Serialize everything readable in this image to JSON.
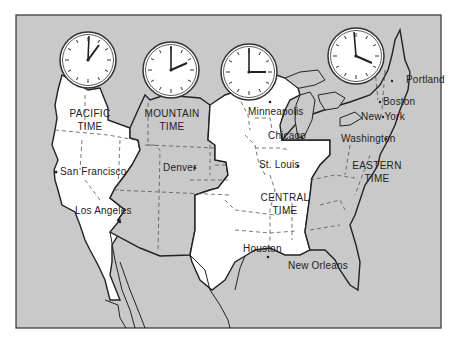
{
  "colors": {
    "water": "#c9c9c9",
    "other_zone_fill": "#c9c9c9",
    "pacific_central_fill": "#ffffff",
    "border": "#222222",
    "dash": "#555555"
  },
  "zones": [
    {
      "name": "PACIFIC",
      "line2": "TIME",
      "clock": {
        "hour": 1,
        "minute": 0
      }
    },
    {
      "name": "MOUNTAIN",
      "line2": "TIME",
      "clock": {
        "hour": 2,
        "minute": 0
      }
    },
    {
      "name": "CENTRAL",
      "line2": "TIME",
      "clock": {
        "hour": 3,
        "minute": 0
      }
    },
    {
      "name": "EASTERN",
      "line2": "TIME",
      "clock": {
        "hour": 4,
        "minute": 0
      }
    }
  ],
  "cities": [
    {
      "name": "San Francisco",
      "zone": "Pacific"
    },
    {
      "name": "Los Angeles",
      "zone": "Pacific"
    },
    {
      "name": "Denver",
      "zone": "Mountain"
    },
    {
      "name": "Minneapolis",
      "zone": "Central"
    },
    {
      "name": "Chicago",
      "zone": "Central"
    },
    {
      "name": "St. Louis",
      "zone": "Central"
    },
    {
      "name": "Houston",
      "zone": "Central"
    },
    {
      "name": "New Orleans",
      "zone": "Central"
    },
    {
      "name": "Portland",
      "zone": "Eastern"
    },
    {
      "name": "Boston",
      "zone": "Eastern"
    },
    {
      "name": "New York",
      "zone": "Eastern"
    },
    {
      "name": "Washington",
      "zone": "Eastern"
    }
  ]
}
